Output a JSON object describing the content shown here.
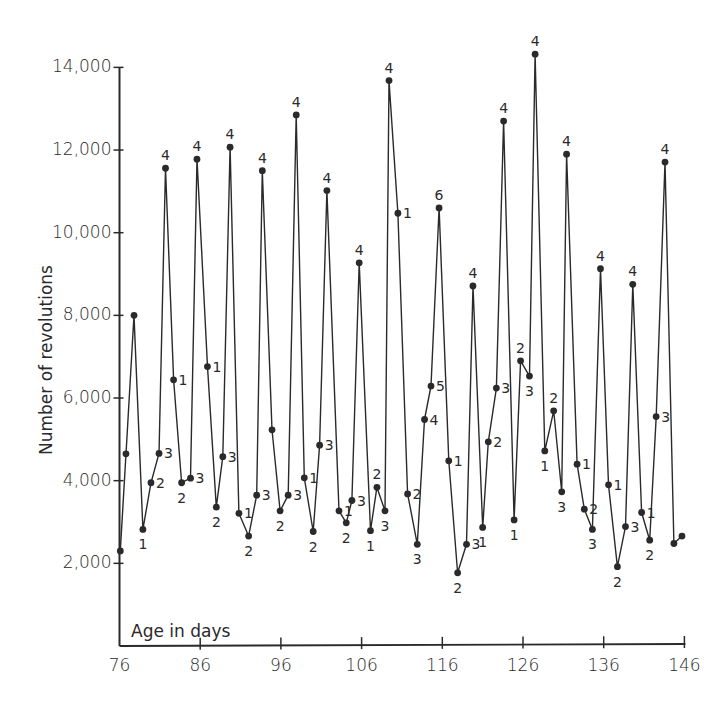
{
  "chart_data": {
    "type": "line",
    "title": "",
    "xlabel": "Age in days",
    "ylabel": "Number of revolutions",
    "xlim": [
      76,
      146
    ],
    "ylim": [
      0,
      14000
    ],
    "grid": false,
    "legend": null,
    "x_ticks": [
      76,
      86,
      96,
      106,
      116,
      126,
      136,
      146
    ],
    "x_tick_labels": [
      "76",
      "86",
      "96",
      "106",
      "116",
      "126",
      "136",
      "146"
    ],
    "y_ticks": [
      2000,
      4000,
      6000,
      8000,
      10000,
      12000,
      14000
    ],
    "y_tick_labels": [
      "2,000",
      "4,000",
      "6,000",
      "8,000",
      "10,000",
      "12,000",
      "14,000"
    ],
    "series": [
      {
        "name": "Daily running-wheel revolutions",
        "points": [
          {
            "x": 76.1,
            "y": 2300,
            "label": ""
          },
          {
            "x": 76.8,
            "y": 4650,
            "label": ""
          },
          {
            "x": 77.8,
            "y": 8000,
            "label": ""
          },
          {
            "x": 78.9,
            "y": 2820,
            "label": "1"
          },
          {
            "x": 79.9,
            "y": 3950,
            "label": "2"
          },
          {
            "x": 80.9,
            "y": 4660,
            "label": "3"
          },
          {
            "x": 81.7,
            "y": 11560,
            "label": "4"
          },
          {
            "x": 82.7,
            "y": 6440,
            "label": "1"
          },
          {
            "x": 83.7,
            "y": 3950,
            "label": "2"
          },
          {
            "x": 84.8,
            "y": 4060,
            "label": "3"
          },
          {
            "x": 85.6,
            "y": 11780,
            "label": "4"
          },
          {
            "x": 86.9,
            "y": 6760,
            "label": "1"
          },
          {
            "x": 88.0,
            "y": 3360,
            "label": "2"
          },
          {
            "x": 88.8,
            "y": 4580,
            "label": "3"
          },
          {
            "x": 89.7,
            "y": 12070,
            "label": "4"
          },
          {
            "x": 90.8,
            "y": 3210,
            "label": "1"
          },
          {
            "x": 92.0,
            "y": 2660,
            "label": "2"
          },
          {
            "x": 93.0,
            "y": 3650,
            "label": "3"
          },
          {
            "x": 93.7,
            "y": 11500,
            "label": "4"
          },
          {
            "x": 94.9,
            "y": 5230,
            "label": ""
          },
          {
            "x": 95.9,
            "y": 3270,
            "label": "2"
          },
          {
            "x": 96.9,
            "y": 3650,
            "label": "3"
          },
          {
            "x": 97.9,
            "y": 12850,
            "label": "4"
          },
          {
            "x": 98.9,
            "y": 4070,
            "label": "1"
          },
          {
            "x": 100.0,
            "y": 2770,
            "label": "2"
          },
          {
            "x": 100.8,
            "y": 4860,
            "label": "3"
          },
          {
            "x": 101.7,
            "y": 11020,
            "label": "4"
          },
          {
            "x": 103.2,
            "y": 3270,
            "label": "1"
          },
          {
            "x": 104.1,
            "y": 2980,
            "label": "2"
          },
          {
            "x": 104.8,
            "y": 3520,
            "label": "3"
          },
          {
            "x": 105.7,
            "y": 9270,
            "label": "4"
          },
          {
            "x": 107.1,
            "y": 2790,
            "label": "1"
          },
          {
            "x": 107.9,
            "y": 3840,
            "label": "2"
          },
          {
            "x": 108.9,
            "y": 3270,
            "label": "3"
          },
          {
            "x": 109.4,
            "y": 13680,
            "label": "4"
          },
          {
            "x": 110.5,
            "y": 10470,
            "label": "1"
          },
          {
            "x": 111.7,
            "y": 3680,
            "label": "2"
          },
          {
            "x": 112.9,
            "y": 2460,
            "label": "3"
          },
          {
            "x": 113.8,
            "y": 5480,
            "label": "4"
          },
          {
            "x": 114.6,
            "y": 6290,
            "label": "5"
          },
          {
            "x": 115.6,
            "y": 10600,
            "label": "6"
          },
          {
            "x": 116.8,
            "y": 4480,
            "label": "1"
          },
          {
            "x": 117.9,
            "y": 1770,
            "label": "2"
          },
          {
            "x": 119.0,
            "y": 2460,
            "label": "3"
          },
          {
            "x": 119.8,
            "y": 8710,
            "label": "4"
          },
          {
            "x": 121.0,
            "y": 2870,
            "label": "1"
          },
          {
            "x": 121.7,
            "y": 4940,
            "label": "2"
          },
          {
            "x": 122.7,
            "y": 6240,
            "label": "3"
          },
          {
            "x": 123.6,
            "y": 12700,
            "label": "4"
          },
          {
            "x": 124.9,
            "y": 3050,
            "label": "1"
          },
          {
            "x": 125.7,
            "y": 6900,
            "label": "2"
          },
          {
            "x": 126.8,
            "y": 6530,
            "label": "3"
          },
          {
            "x": 127.5,
            "y": 14320,
            "label": "4"
          },
          {
            "x": 128.7,
            "y": 4720,
            "label": "1"
          },
          {
            "x": 129.8,
            "y": 5690,
            "label": "2"
          },
          {
            "x": 130.8,
            "y": 3730,
            "label": "3"
          },
          {
            "x": 131.4,
            "y": 11900,
            "label": "4"
          },
          {
            "x": 132.7,
            "y": 4400,
            "label": "1"
          },
          {
            "x": 133.6,
            "y": 3310,
            "label": "2"
          },
          {
            "x": 134.6,
            "y": 2820,
            "label": "3"
          },
          {
            "x": 135.6,
            "y": 9130,
            "label": "4"
          },
          {
            "x": 136.6,
            "y": 3900,
            "label": "1"
          },
          {
            "x": 137.7,
            "y": 1920,
            "label": "2"
          },
          {
            "x": 138.7,
            "y": 2890,
            "label": "3"
          },
          {
            "x": 139.6,
            "y": 8750,
            "label": "4"
          },
          {
            "x": 140.7,
            "y": 3230,
            "label": "1"
          },
          {
            "x": 141.7,
            "y": 2560,
            "label": "2"
          },
          {
            "x": 142.5,
            "y": 5550,
            "label": "3"
          },
          {
            "x": 143.6,
            "y": 11710,
            "label": "4"
          },
          {
            "x": 144.7,
            "y": 2480,
            "label": ""
          },
          {
            "x": 145.7,
            "y": 2660,
            "label": ""
          }
        ]
      }
    ]
  },
  "colors": {
    "ink": "#2a2a2a",
    "background": "#ffffff"
  },
  "layout": {
    "plot_left_px": 119.5,
    "px_per_day": 8.07,
    "x_axis_y_px": 646,
    "px_per_1000": 41.33,
    "y_axis_top_px": 67
  }
}
